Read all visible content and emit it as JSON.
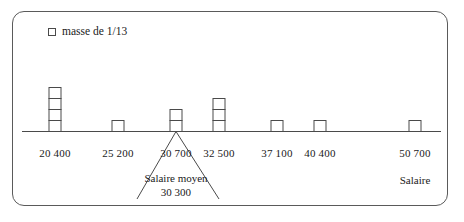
{
  "legend": {
    "marker_icon": "square-outline-icon",
    "label": "masse de 1/13"
  },
  "axis": {
    "title": "Salaire",
    "line_color": "#4a4a4a"
  },
  "annotation": {
    "line1": "Salaire moyen",
    "line2": "30 300",
    "pointer_icon": "v-pointer-icon"
  },
  "chart_data": {
    "type": "bar",
    "title": "",
    "subtitle": "",
    "xlabel": "Salaire",
    "ylabel": "",
    "grid": false,
    "legend_position": "top-left",
    "legend_entries": [
      "masse de 1/13"
    ],
    "unit_mass": "1/13",
    "categories": [
      "20 400",
      "25 200",
      "30 700",
      "32 500",
      "37 100",
      "40 400",
      "50 700"
    ],
    "x": [
      20400,
      25200,
      30700,
      32500,
      37100,
      40400,
      50700
    ],
    "values": [
      4,
      1,
      2,
      3,
      1,
      1,
      1
    ],
    "value_unit": "blocks of mass 1/13",
    "xlim": [
      18000,
      53000
    ],
    "ylim": [
      0,
      5
    ],
    "annotations": [
      {
        "text": "Salaire moyen 30 300",
        "value": 30300,
        "target_x": 30700
      }
    ]
  },
  "ticks": [
    {
      "label": "20 400",
      "x": 55
    },
    {
      "label": "25 200",
      "x": 118
    },
    {
      "label": "30 700",
      "x": 176
    },
    {
      "label": "32 500",
      "x": 219
    },
    {
      "label": "37 100",
      "x": 277
    },
    {
      "label": "40 400",
      "x": 320
    },
    {
      "label": "50 700",
      "x": 415
    }
  ],
  "bars": [
    {
      "category": "20 400",
      "x": 55,
      "blocks": 4
    },
    {
      "category": "25 200",
      "x": 118,
      "blocks": 1
    },
    {
      "category": "30 700",
      "x": 176,
      "blocks": 2
    },
    {
      "category": "32 500",
      "x": 219,
      "blocks": 3
    },
    {
      "category": "37 100",
      "x": 277,
      "blocks": 1
    },
    {
      "category": "40 400",
      "x": 320,
      "blocks": 1
    },
    {
      "category": "50 700",
      "x": 415,
      "blocks": 1
    }
  ]
}
